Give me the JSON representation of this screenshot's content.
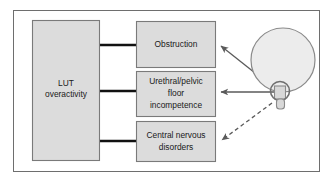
{
  "figure": {
    "background_color": "#ffffff",
    "frame_color": "#6e6e6e"
  },
  "nodes": {
    "source": {
      "id": "lut-overactivity",
      "lines": [
        "LUT",
        "overactivity"
      ],
      "fill": "#dcdcdc",
      "stroke": "#7a7a7a"
    },
    "targets": [
      {
        "id": "obstruction",
        "lines": [
          "Obstruction"
        ],
        "fill": "#dcdcdc",
        "stroke": "#7a7a7a"
      },
      {
        "id": "urethral-pelvic-floor-incompetence",
        "lines": [
          "Urethral/pelvic",
          "floor",
          "incompetence"
        ],
        "fill": "#dcdcdc",
        "stroke": "#7a7a7a"
      },
      {
        "id": "central-nervous-disorders",
        "lines": [
          "Central nervous",
          "disorders"
        ],
        "fill": "#dcdcdc",
        "stroke": "#7a7a7a"
      }
    ]
  },
  "connectors": [
    {
      "id": "lut-to-obstruction",
      "style": "solid-thick",
      "color": "#111111"
    },
    {
      "id": "lut-to-incompetence",
      "style": "solid-thick",
      "color": "#111111"
    },
    {
      "id": "lut-to-cns",
      "style": "solid-thick",
      "color": "#111111"
    }
  ],
  "arrows": [
    {
      "id": "bladder-to-obstruction",
      "style": "solid",
      "color": "#5a5a5a",
      "direction": "up-left"
    },
    {
      "id": "bladder-to-incompetence",
      "style": "solid",
      "color": "#5a5a5a",
      "direction": "left"
    },
    {
      "id": "bladder-to-cns",
      "style": "dashed",
      "color": "#5a5a5a",
      "direction": "down-left"
    }
  ],
  "organ": {
    "id": "bladder-glyph",
    "parts": [
      "bladder-dome",
      "sphincter-ring",
      "urethra-stem"
    ],
    "fill": "#ececec",
    "stroke": "#8a8a8a"
  }
}
